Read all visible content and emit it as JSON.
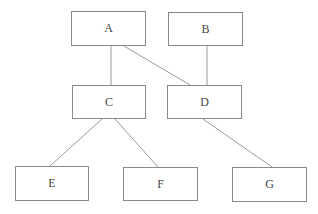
{
  "diagram": {
    "type": "tree",
    "nodes": [
      {
        "id": "A",
        "label": "A",
        "x": 71,
        "y": 11,
        "w": 75,
        "h": 35
      },
      {
        "id": "B",
        "label": "B",
        "x": 168,
        "y": 12,
        "w": 75,
        "h": 34
      },
      {
        "id": "C",
        "label": "C",
        "x": 72,
        "y": 85,
        "w": 74,
        "h": 34
      },
      {
        "id": "D",
        "label": "D",
        "x": 167,
        "y": 85,
        "w": 75,
        "h": 34
      },
      {
        "id": "E",
        "label": "E",
        "x": 15,
        "y": 166,
        "w": 74,
        "h": 35
      },
      {
        "id": "F",
        "label": "F",
        "x": 123,
        "y": 167,
        "w": 75,
        "h": 34
      },
      {
        "id": "G",
        "label": "G",
        "x": 232,
        "y": 167,
        "w": 75,
        "h": 35
      }
    ],
    "edges": [
      {
        "from": "A",
        "to": "C"
      },
      {
        "from": "A",
        "to": "D"
      },
      {
        "from": "B",
        "to": "D"
      },
      {
        "from": "C",
        "to": "E"
      },
      {
        "from": "C",
        "to": "F"
      },
      {
        "from": "D",
        "to": "G"
      }
    ],
    "line_color": "#999999"
  }
}
